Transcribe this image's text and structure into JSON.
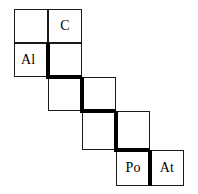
{
  "diagram": {
    "type": "staircase-grid",
    "background_color": "#ffffff",
    "line_color": "#1a1a1a",
    "stair_color": "#000000",
    "grid": {
      "columns_x": [
        14,
        48,
        82,
        116,
        150,
        184
      ],
      "rows_y": [
        9,
        43,
        77,
        111,
        150,
        186
      ]
    },
    "cells": [
      {
        "name": "cell-r1c0",
        "label": "",
        "col": 0,
        "row": 0,
        "x": 14,
        "y": 9,
        "w": 34,
        "h": 34,
        "align": "center"
      },
      {
        "name": "cell-r1c1",
        "label": "C",
        "col": 1,
        "row": 0,
        "x": 48,
        "y": 9,
        "w": 34,
        "h": 34,
        "align": "center"
      },
      {
        "name": "cell-r2c0",
        "label": "Al",
        "col": 0,
        "row": 1,
        "x": 14,
        "y": 43,
        "w": 34,
        "h": 34,
        "align": "left"
      },
      {
        "name": "cell-r2c1",
        "label": "",
        "col": 1,
        "row": 1,
        "x": 48,
        "y": 43,
        "w": 34,
        "h": 34,
        "align": "center"
      },
      {
        "name": "cell-r3c1",
        "label": "",
        "col": 1,
        "row": 2,
        "x": 48,
        "y": 77,
        "w": 34,
        "h": 34,
        "align": "center"
      },
      {
        "name": "cell-r3c2",
        "label": "",
        "col": 2,
        "row": 2,
        "x": 82,
        "y": 77,
        "w": 34,
        "h": 34,
        "align": "center"
      },
      {
        "name": "cell-r4c2",
        "label": "",
        "col": 2,
        "row": 3,
        "x": 82,
        "y": 111,
        "w": 34,
        "h": 39,
        "align": "center"
      },
      {
        "name": "cell-r4c3",
        "label": "",
        "col": 3,
        "row": 3,
        "x": 116,
        "y": 111,
        "w": 34,
        "h": 39,
        "align": "center"
      },
      {
        "name": "cell-r5c3",
        "label": "Po",
        "col": 3,
        "row": 4,
        "x": 116,
        "y": 150,
        "w": 34,
        "h": 36,
        "align": "center"
      },
      {
        "name": "cell-r5c4",
        "label": "At",
        "col": 4,
        "row": 4,
        "x": 150,
        "y": 150,
        "w": 34,
        "h": 36,
        "align": "center"
      }
    ],
    "stair_segments": [
      {
        "name": "stair-v-1",
        "orient": "vertical",
        "x": 46,
        "y": 43,
        "w": 4,
        "h": 36
      },
      {
        "name": "stair-h-1",
        "orient": "horizontal",
        "x": 46,
        "y": 75,
        "w": 36,
        "h": 4
      },
      {
        "name": "stair-v-2",
        "orient": "vertical",
        "x": 80,
        "y": 77,
        "w": 4,
        "h": 36
      },
      {
        "name": "stair-h-2",
        "orient": "horizontal",
        "x": 80,
        "y": 109,
        "w": 36,
        "h": 4
      },
      {
        "name": "stair-v-3",
        "orient": "vertical",
        "x": 114,
        "y": 111,
        "w": 4,
        "h": 41
      },
      {
        "name": "stair-h-3",
        "orient": "horizontal",
        "x": 114,
        "y": 148,
        "w": 36,
        "h": 4
      },
      {
        "name": "stair-v-4",
        "orient": "vertical",
        "x": 148,
        "y": 150,
        "w": 4,
        "h": 36
      }
    ],
    "legend_symbols": [
      "C",
      "Al",
      "Po",
      "At"
    ]
  }
}
